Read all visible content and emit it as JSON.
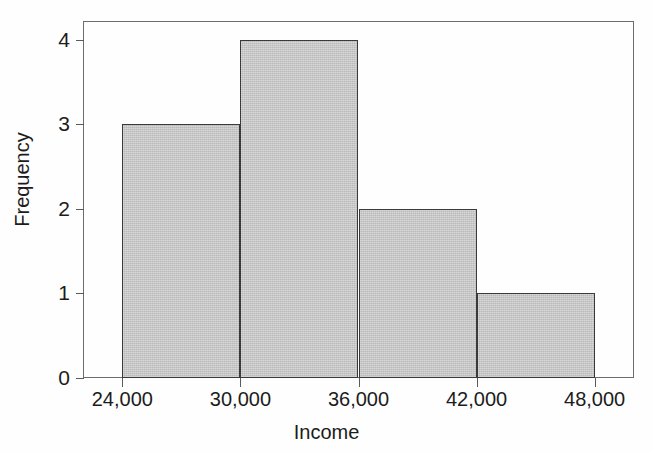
{
  "chart_data": {
    "type": "bar",
    "subtype": "histogram",
    "title": "",
    "xlabel": "Income",
    "ylabel": "Frequency",
    "categories": [
      "24,000-30,000",
      "30,000-36,000",
      "36,000-42,000",
      "42,000-48,000"
    ],
    "values": [
      3,
      4,
      2,
      1
    ],
    "bin_edges": [
      24000,
      30000,
      36000,
      42000,
      48000
    ],
    "bin_width": 6000,
    "x": [
      24000,
      30000,
      36000,
      42000,
      48000
    ],
    "xlim": [
      22000,
      50000
    ],
    "ylim": [
      0,
      4.22
    ],
    "x_tick_labels": [
      "24,000",
      "30,000",
      "36,000",
      "42,000",
      "48,000"
    ],
    "x_tick_values": [
      24000,
      30000,
      36000,
      42000,
      48000
    ],
    "y_tick_labels": [
      "0",
      "1",
      "2",
      "3",
      "4"
    ],
    "y_tick_values": [
      0,
      1,
      2,
      3,
      4
    ],
    "grid": false,
    "legend": false,
    "legend_position": "none",
    "bar_fill_color": "#c9c9c9",
    "bar_edge_color": "#3a3a3a",
    "axis_color": "#5a5a5a",
    "background_color": "#ffffff",
    "text_color": "#1c1c1c",
    "total_frequency": 10
  },
  "axes": {
    "x_title": "Income",
    "y_title": "Frequency"
  },
  "ticks": {
    "y": [
      {
        "label": "4",
        "value": 4
      },
      {
        "label": "3",
        "value": 3
      },
      {
        "label": "2",
        "value": 2
      },
      {
        "label": "1",
        "value": 1
      },
      {
        "label": "0",
        "value": 0
      }
    ],
    "x": [
      {
        "label": "24,000",
        "value": 24000
      },
      {
        "label": "30,000",
        "value": 30000
      },
      {
        "label": "36,000",
        "value": 36000
      },
      {
        "label": "42,000",
        "value": 42000
      },
      {
        "label": "48,000",
        "value": 48000
      }
    ]
  },
  "bars": [
    {
      "label": "24,000-30,000",
      "value": 3
    },
    {
      "label": "30,000-36,000",
      "value": 4
    },
    {
      "label": "36,000-42,000",
      "value": 2
    },
    {
      "label": "42,000-48,000",
      "value": 1
    }
  ]
}
